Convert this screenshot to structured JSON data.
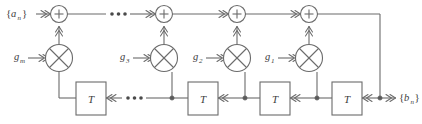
{
  "diagram": {
    "kind": "signal-flow-block-diagram",
    "background_color": "#ffffff",
    "line_color": "#6b6b6b",
    "text_color": "#3c3c3c",
    "input": {
      "label_open": "{",
      "label_letter": "a",
      "label_sub": "n",
      "label_close": "}",
      "label_full": "{a_n}"
    },
    "output": {
      "label_open": "{",
      "label_letter": "b",
      "label_sub": "n",
      "label_close": "}",
      "label_full": "{b_n}"
    },
    "adders": [
      {
        "id": "adder-m",
        "glyph": "+"
      },
      {
        "id": "adder-3",
        "glyph": "+"
      },
      {
        "id": "adder-2",
        "glyph": "+"
      },
      {
        "id": "adder-1",
        "glyph": "+"
      }
    ],
    "multipliers": [
      {
        "id": "multiplier-m",
        "glyph": "x",
        "gain_letter": "g",
        "gain_sub": "m",
        "gain_full": "g_m"
      },
      {
        "id": "multiplier-3",
        "glyph": "x",
        "gain_letter": "g",
        "gain_sub": "3",
        "gain_full": "g_3"
      },
      {
        "id": "multiplier-2",
        "glyph": "x",
        "gain_letter": "g",
        "gain_sub": "2",
        "gain_full": "g_2"
      },
      {
        "id": "multiplier-1",
        "glyph": "x",
        "gain_letter": "g",
        "gain_sub": "1",
        "gain_full": "g_1"
      }
    ],
    "delays": [
      {
        "id": "delay-block-4",
        "label": "T"
      },
      {
        "id": "delay-block-3",
        "label": "T"
      },
      {
        "id": "delay-block-2",
        "label": "T"
      },
      {
        "id": "delay-block-1",
        "label": "T"
      }
    ],
    "ellipses": [
      {
        "id": "ellipsis-top",
        "glyph": "..."
      },
      {
        "id": "ellipsis-bottom",
        "glyph": "..."
      }
    ]
  }
}
